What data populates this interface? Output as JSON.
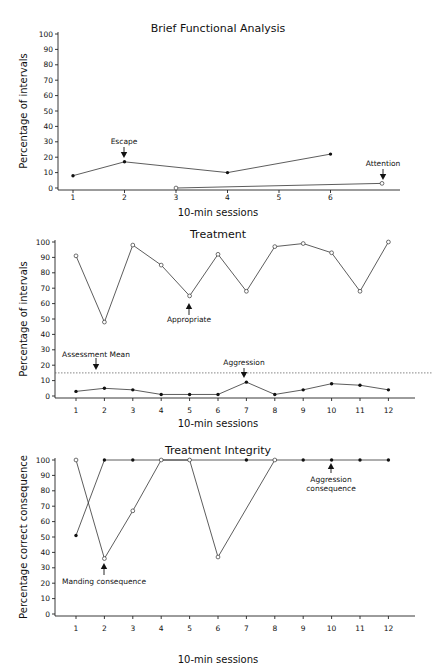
{
  "chart_data": [
    {
      "type": "line",
      "title": "Brief Functional Analysis",
      "xlabel": "10-min sessions",
      "ylabel": "Percentage of intervals",
      "ylim": [
        0,
        100
      ],
      "yticks": [
        0,
        10,
        20,
        30,
        40,
        50,
        60,
        70,
        80,
        90,
        100
      ],
      "xticks": [
        1,
        2,
        3,
        4,
        5,
        6
      ],
      "series": [
        {
          "name": "Escape",
          "marker": "filled",
          "x": [
            1,
            2,
            4,
            6
          ],
          "values": [
            8,
            17,
            10,
            22
          ]
        },
        {
          "name": "Attention",
          "marker": "open",
          "x": [
            3,
            7
          ],
          "values": [
            0,
            3
          ]
        }
      ],
      "annotations": [
        {
          "text": "Escape",
          "x": 2,
          "y": 17
        },
        {
          "text": "Attention",
          "x": 7,
          "y": 3
        }
      ]
    },
    {
      "type": "line",
      "title": "Treatment",
      "xlabel": "10-min sessions",
      "ylabel": "Percentage of intervals",
      "ylim": [
        0,
        100
      ],
      "yticks": [
        0,
        10,
        20,
        30,
        40,
        50,
        60,
        70,
        80,
        90,
        100
      ],
      "xticks": [
        1,
        2,
        3,
        4,
        5,
        6,
        7,
        8,
        9,
        10,
        11,
        12
      ],
      "series": [
        {
          "name": "Appropriate",
          "marker": "open",
          "x": [
            1,
            2,
            3,
            4,
            5,
            6,
            7,
            8,
            9,
            10,
            11,
            12
          ],
          "values": [
            91,
            48,
            98,
            85,
            65,
            92,
            68,
            97,
            99,
            93,
            68,
            100
          ]
        },
        {
          "name": "Aggression",
          "marker": "filled",
          "x": [
            1,
            2,
            3,
            4,
            5,
            6,
            7,
            8,
            9,
            10,
            11,
            12
          ],
          "values": [
            3,
            5,
            4,
            1,
            1,
            1,
            9,
            1,
            4,
            8,
            7,
            4
          ]
        }
      ],
      "reference_line": {
        "name": "Assessment Mean",
        "value": 15,
        "style": "dashed"
      },
      "annotations": [
        {
          "text": "Appropriate",
          "x": 5,
          "y": 65
        },
        {
          "text": "Assessment Mean",
          "x": 2,
          "y": 15
        },
        {
          "text": "Aggression",
          "x": 7,
          "y": 9
        }
      ]
    },
    {
      "type": "line",
      "title": "Treatment Integrity",
      "xlabel": "10-min sessions",
      "ylabel": "Percentage correct consequence",
      "ylim": [
        0,
        100
      ],
      "yticks": [
        0,
        10,
        20,
        30,
        40,
        50,
        60,
        70,
        80,
        90,
        100
      ],
      "xticks": [
        1,
        2,
        3,
        4,
        5,
        6,
        7,
        8,
        9,
        10,
        11,
        12
      ],
      "series": [
        {
          "name": "Aggression consequence",
          "marker": "filled",
          "x": [
            1,
            2,
            3,
            7,
            9,
            10,
            11,
            12
          ],
          "values": [
            51,
            100,
            100,
            100,
            100,
            100,
            100,
            100
          ]
        },
        {
          "name": "Manding consequence",
          "marker": "open",
          "x": [
            1,
            2,
            3,
            4,
            5,
            6,
            8
          ],
          "values": [
            100,
            36,
            67,
            100,
            100,
            37,
            100
          ]
        }
      ],
      "annotations": [
        {
          "text": "Manding consequence",
          "x": 2,
          "y": 36
        },
        {
          "text": "Aggression consequence",
          "x": 10,
          "y": 100
        }
      ]
    }
  ]
}
